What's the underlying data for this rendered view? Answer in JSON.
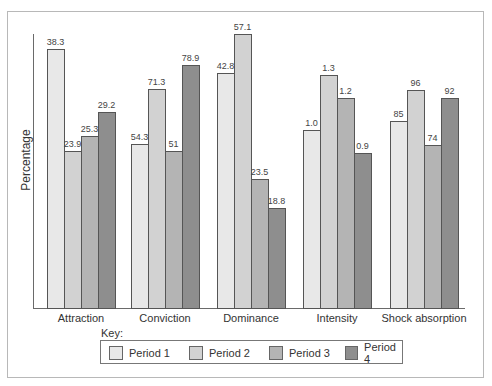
{
  "chart_data": {
    "type": "bar",
    "title": "",
    "xlabel": "",
    "ylabel": "Percentage",
    "grid": false,
    "legend_position": "bottom",
    "legend_title": "Key:",
    "categories": [
      "Attraction",
      "Conviction",
      "Dominance",
      "Intensity",
      "Shock absorption"
    ],
    "series": [
      {
        "name": "Period 1",
        "color": "#e8e8e8",
        "values": [
          38.3,
          54.3,
          42.8,
          1.0,
          85
        ],
        "labels": [
          "38.3",
          "54.3",
          "42.8",
          "1.0",
          "85"
        ]
      },
      {
        "name": "Period 2",
        "color": "#d2d2d2",
        "values": [
          23.9,
          71.3,
          57.1,
          1.3,
          96
        ],
        "labels": [
          "23.9",
          "71.3",
          "57.1",
          "1.3",
          "96"
        ]
      },
      {
        "name": "Period 3",
        "color": "#b4b4b4",
        "values": [
          25.3,
          51,
          23.5,
          1.2,
          74
        ],
        "labels": [
          "25.3",
          "51",
          "23.5",
          "1.2",
          "74"
        ]
      },
      {
        "name": "Period 4",
        "color": "#8e8e8e",
        "values": [
          29.2,
          78.9,
          18.8,
          0.9,
          92
        ],
        "labels": [
          "29.2",
          "78.9",
          "18.8",
          "0.9",
          "92"
        ]
      }
    ]
  },
  "layout": {
    "baseline_y": 308,
    "bar_width": 17,
    "group_left_x": [
      47,
      131,
      217,
      303,
      390
    ],
    "bar_tops": [
      [
        49,
        151,
        136,
        112
      ],
      [
        144,
        89,
        151,
        65
      ],
      [
        73,
        34,
        179,
        208
      ],
      [
        130,
        75,
        98,
        153
      ],
      [
        121,
        90,
        145,
        98
      ]
    ]
  },
  "legend": {
    "items": [
      {
        "label": "Period 1",
        "x": 8
      },
      {
        "label": "Period 2",
        "x": 88
      },
      {
        "label": "Period 3",
        "x": 168
      },
      {
        "label": "Period 4",
        "x": 244
      }
    ]
  }
}
